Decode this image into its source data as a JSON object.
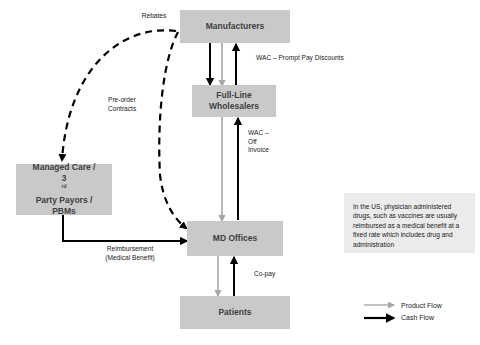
{
  "diagram": {
    "colors": {
      "node_fill": "#c9c9c9",
      "node_text": "#404040",
      "callout_fill": "#ebebeb",
      "product_flow": "#a6a6a6",
      "cash_flow": "#000000",
      "dashed_flow": "#000000",
      "background": "#ffffff"
    },
    "nodes": [
      {
        "id": "manufacturers",
        "label": "Manufacturers"
      },
      {
        "id": "wholesalers",
        "label_line1": "Full-Line",
        "label_line2": "Wholesalers"
      },
      {
        "id": "payors",
        "label_line1": "Managed Care /",
        "label_line2_pre": "3",
        "label_line2_sup": "rd",
        "label_line2_post": " Party Payors /",
        "label_line3": "PBMs"
      },
      {
        "id": "md_offices",
        "label": "MD Offices"
      },
      {
        "id": "patients",
        "label": "Patients"
      }
    ],
    "edge_labels": {
      "rebates": "Rebates",
      "preorder_contracts": "Pre-order\nContracts",
      "wac_prompt_pay": "WAC – Prompt Pay Discounts",
      "wac_off_invoice": "WAC –\nOff\nInvoice",
      "reimbursement": "Reimbursement\n(Medical Benefit)",
      "copay": "Co-pay"
    },
    "callout": {
      "text": "In the US, physician administered drugs, such as vaccines are usually reimbursed as a medical benefit at a fixed rate which includes drug and administration"
    },
    "legend": {
      "items": [
        {
          "id": "product-flow",
          "label": "Product Flow",
          "color": "#a6a6a6"
        },
        {
          "id": "cash-flow",
          "label": "Cash Flow",
          "color": "#000000"
        }
      ]
    }
  }
}
